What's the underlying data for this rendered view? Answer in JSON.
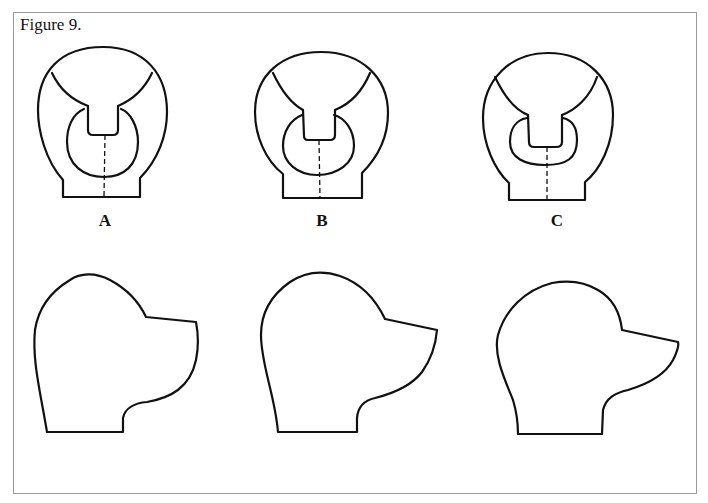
{
  "figure": {
    "title": "Figure 9.",
    "front_views": [
      {
        "label": "A"
      },
      {
        "label": "B"
      },
      {
        "label": "C"
      }
    ],
    "side_views": [
      {
        "name": "profile-1"
      },
      {
        "name": "profile-2"
      },
      {
        "name": "profile-3"
      }
    ],
    "line_color": "#111111",
    "frame_color": "#9a9a9a"
  }
}
